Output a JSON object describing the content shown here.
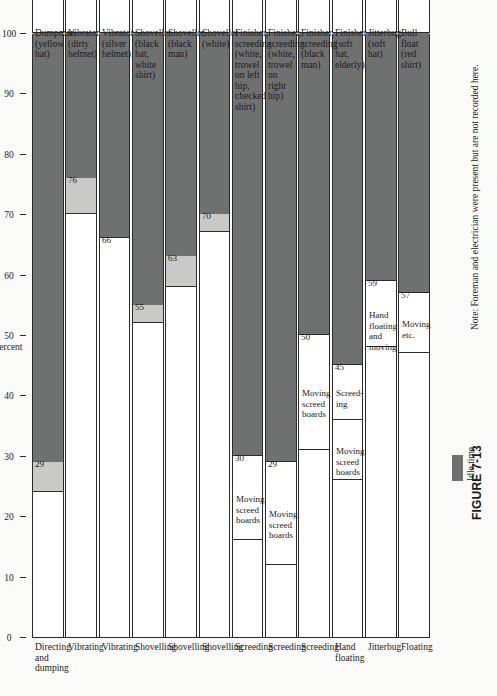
{
  "figure": {
    "label": "FIGURE 7-13",
    "note": "Note:  Foreman and electrician were present but are not recorded here."
  },
  "axis": {
    "title": "Percent",
    "ticks": [
      0,
      10,
      20,
      30,
      40,
      50,
      60,
      70,
      80,
      90,
      100
    ],
    "min": 0,
    "max": 100
  },
  "legend": {
    "items": [
      {
        "label": "Idle time",
        "color": "#6f7070"
      },
      {
        "label": "Other work",
        "color": "#c9c9c7"
      }
    ]
  },
  "colors": {
    "idle": "#6f7070",
    "other": "#c9c9c7",
    "work": "#ffffff",
    "line": "#2b2b2b",
    "page": "#fbfbfa"
  },
  "chart_data": {
    "type": "bar",
    "title": "FIGURE 7-13",
    "orientation": "vertical-stacked",
    "xlabel": "",
    "ylabel": "Percent",
    "ylim": [
      0,
      100
    ],
    "grid": false,
    "legend_position": "bottom",
    "legend": [
      "Idle time",
      "Other work"
    ],
    "categories": [
      "Directing and dumping",
      "Vibrating",
      "Vibrating",
      "Shovelling",
      "Shovelling",
      "Shovelling",
      "Screeding",
      "Screeding",
      "Screeding",
      "Hand floating",
      "Jitterbug",
      "Floating"
    ],
    "descriptors": [
      "Dumpman\n(yellow hat)",
      "Vibrator\n(dirty helmet)",
      "Vibrator\n(silver helmet)",
      "Shoveller\n(black hat, white shirt)",
      "Shoveller\n(black man)",
      "Shoveller\n(white)",
      "Finisher, screeding\n(white, trowel on left hip,\nchecked shirt)",
      "Finisher, screeding\n(white, trowel on right hip)",
      "Finisher, screeding\n(black man)",
      "Finisher\n(soft hat, elderly)",
      "Jitterbug\n(soft hat)",
      "Bull float\n(red shirt)"
    ],
    "bars": [
      {
        "category": "Directing and dumping",
        "descriptor": "Dumpman\n(yellow hat)",
        "work_end": 24,
        "other_end": 29,
        "idle_end": 100,
        "value_label": "29",
        "work_segments": [
          {
            "label": "",
            "start": 0,
            "end": 24
          }
        ]
      },
      {
        "category": "Vibrating",
        "descriptor": "Vibrator\n(dirty helmet)",
        "work_end": 70,
        "other_end": 76,
        "idle_end": 100,
        "value_label": "76",
        "work_segments": [
          {
            "label": "",
            "start": 0,
            "end": 70
          }
        ]
      },
      {
        "category": "Vibrating",
        "descriptor": "Vibrator\n(silver helmet)",
        "work_end": 66,
        "other_end": 66,
        "idle_end": 100,
        "value_label": "66",
        "work_segments": [
          {
            "label": "",
            "start": 0,
            "end": 66
          }
        ]
      },
      {
        "category": "Shovelling",
        "descriptor": "Shoveller\n(black hat, white shirt)",
        "work_end": 52,
        "other_end": 55,
        "idle_end": 100,
        "value_label": "55",
        "work_segments": [
          {
            "label": "",
            "start": 0,
            "end": 52
          }
        ]
      },
      {
        "category": "Shovelling",
        "descriptor": "Shoveller\n(black man)",
        "work_end": 58,
        "other_end": 63,
        "idle_end": 100,
        "value_label": "63",
        "work_segments": [
          {
            "label": "",
            "start": 0,
            "end": 58
          }
        ]
      },
      {
        "category": "Shovelling",
        "descriptor": "Shoveller\n(white)",
        "work_end": 67,
        "other_end": 70,
        "idle_end": 100,
        "value_label": "70",
        "work_segments": [
          {
            "label": "",
            "start": 0,
            "end": 67
          }
        ]
      },
      {
        "category": "Screeding",
        "descriptor": "Finisher, screeding\n(white, trowel on left hip,\nchecked shirt)",
        "work_end": 30,
        "other_end": 30,
        "idle_end": 100,
        "value_label": "30",
        "work_segments": [
          {
            "label": "",
            "start": 0,
            "end": 16
          },
          {
            "label": "Moving\nscreed\nboards",
            "start": 16,
            "end": 30
          }
        ]
      },
      {
        "category": "Screeding",
        "descriptor": "Finisher, screeding\n(white, trowel on right hip)",
        "work_end": 29,
        "other_end": 29,
        "idle_end": 100,
        "value_label": "29",
        "work_segments": [
          {
            "label": "",
            "start": 0,
            "end": 12
          },
          {
            "label": "Moving\nscreed\nboards",
            "start": 12,
            "end": 29
          }
        ]
      },
      {
        "category": "Screeding",
        "descriptor": "Finisher, screeding\n(black man)",
        "work_end": 50,
        "other_end": 50,
        "idle_end": 100,
        "value_label": "50",
        "work_segments": [
          {
            "label": "",
            "start": 0,
            "end": 31
          },
          {
            "label": "Moving\nscreed\nboards",
            "start": 31,
            "end": 50
          }
        ]
      },
      {
        "category": "Hand floating",
        "descriptor": "Finisher\n(soft hat, elderly)",
        "work_end": 45,
        "other_end": 45,
        "idle_end": 100,
        "value_label": "45",
        "work_segments": [
          {
            "label": "",
            "start": 0,
            "end": 26
          },
          {
            "label": "Moving\nscreed\nboards",
            "start": 26,
            "end": 36
          },
          {
            "label": "Screed-\ning",
            "start": 36,
            "end": 45
          }
        ]
      },
      {
        "category": "Jitterbug",
        "descriptor": "Jitterbug\n(soft hat)",
        "work_end": 59,
        "other_end": 59,
        "idle_end": 100,
        "value_label": "59",
        "work_segments": [
          {
            "label": "",
            "start": 0,
            "end": 48
          },
          {
            "label": "Hand\nfloating\nand moving",
            "start": 48,
            "end": 59
          }
        ]
      },
      {
        "category": "Floating",
        "descriptor": "Bull float\n(red shirt)",
        "work_end": 57,
        "other_end": 57,
        "idle_end": 100,
        "value_label": "57",
        "work_segments": [
          {
            "label": "",
            "start": 0,
            "end": 47
          },
          {
            "label": "Moving\netc.",
            "start": 47,
            "end": 57
          }
        ]
      }
    ]
  }
}
